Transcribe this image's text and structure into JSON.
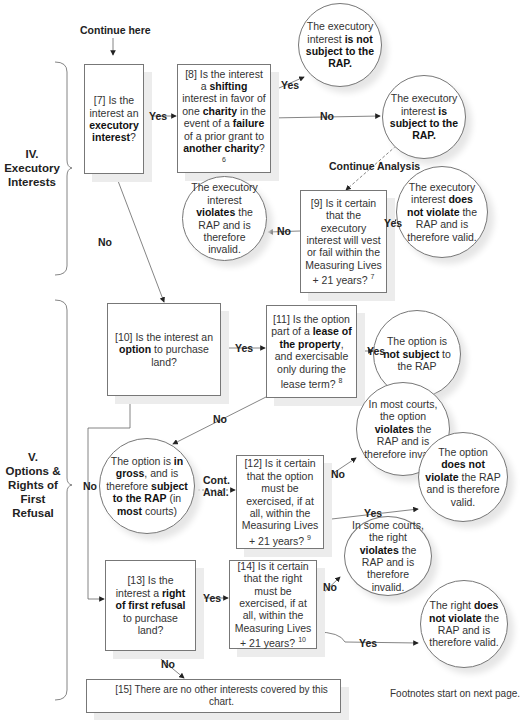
{
  "header": {
    "start_label": "Continue here"
  },
  "sections": [
    {
      "id": "IV",
      "lines": [
        "IV.",
        "Executory",
        "Interests"
      ]
    },
    {
      "id": "V",
      "lines": [
        "V.",
        "Options &",
        "Rights of",
        "First",
        "Refusal"
      ]
    }
  ],
  "nodes": {
    "q7": {
      "pre": "[7] Is the interest an ",
      "bold": "executory interest",
      "post": "?"
    },
    "q8": {
      "p1": "[8] Is the interest a ",
      "b1": "shifting",
      "p2": " interest in favor of one ",
      "b2": "charity",
      "p3": " in the event of a ",
      "b3": "failure",
      "p4": " of a prior grant to ",
      "b4": "another charity",
      "p5": "?",
      "footnote": "6"
    },
    "r_not_subject": {
      "pre": "The executory interest ",
      "bold": "is not subject to the RAP."
    },
    "r_is_subject": {
      "pre": "The executory interest ",
      "bold": "is subject to the RAP."
    },
    "q9": {
      "text": "[9] Is it certain that the executory interest will vest or fail within the Measuring Lives + 21 years?",
      "footnote": "7"
    },
    "r_exec_violates": {
      "pre": "The executory interest ",
      "bold": "violates",
      "post": " the RAP and is therefore invalid."
    },
    "r_exec_valid": {
      "pre": "The executory interest ",
      "bold": "does not violate",
      "post": " the RAP and is therefore valid."
    },
    "q10": {
      "pre": "[10] Is the interest an ",
      "bold": "option",
      "post": " to purchase land?"
    },
    "q11": {
      "pre": "[11] Is the option part of a ",
      "bold": "lease of the property",
      "post": ", and exercisable only during the lease term?",
      "footnote": "8"
    },
    "r_option_not_subject": {
      "pre": "The option is ",
      "bold": "not subject",
      "post": " to the RAP"
    },
    "r_in_gross": {
      "p1": "The option is ",
      "b1": "in gross",
      "p2": ", and is therefore ",
      "b2": "subject to the RAP",
      "p3": " (in ",
      "b3": "most",
      "p4": " courts)"
    },
    "q12": {
      "text": "[12] Is it certain that the option must be exercised, if at all, within the Measuring Lives + 21 years?",
      "footnote": "9"
    },
    "r_option_violates": {
      "pre": "In most courts, the option ",
      "bold": "violates",
      "post": " the RAP and is therefore invalid."
    },
    "r_option_valid": {
      "pre": "The option ",
      "bold": "does not violate",
      "post": " the RAP and is therefore valid."
    },
    "q13": {
      "pre": "[13] Is the interest a ",
      "bold": "right of first refusal",
      "post": " to purchase land?"
    },
    "q14": {
      "text": "[14] Is it certain that the right must be exercised, if at all, within the Measuring Lives + 21 years?",
      "footnote": "10"
    },
    "r_right_violates": {
      "pre": "In some courts, the right ",
      "bold": "violates",
      "post": " the RAP and is therefore invalid."
    },
    "r_right_valid": {
      "pre": "The right ",
      "bold": "does not violate",
      "post": " the RAP and is therefore valid."
    },
    "end15": {
      "text": "[15] There are no other interests covered by this chart."
    }
  },
  "edges": {
    "q7_yes": "Yes",
    "q7_no": "No",
    "q8_yes": "Yes",
    "q8_no": "No",
    "continue_analysis": "Continue Analysis",
    "q9_yes": "Yes",
    "q9_no": "No",
    "q10_yes": "Yes",
    "q10_no": "No",
    "q11_yes": "Yes",
    "q11_no": "No",
    "cont_anal_1": "Cont.",
    "cont_anal_2": "Anal.",
    "q12_no": "No",
    "q12_yes": "Yes",
    "q13_yes": "Yes",
    "q13_no": "No",
    "q14_no": "No",
    "q14_yes": "Yes"
  },
  "footer": {
    "note": "Footnotes start on next page."
  }
}
